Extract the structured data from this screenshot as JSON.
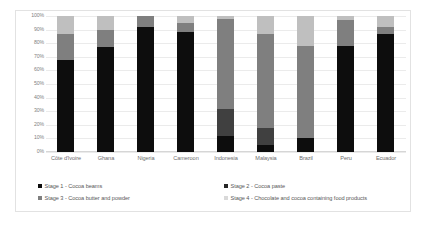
{
  "chart_data": {
    "type": "bar",
    "subtype": "stacked-percentage-column",
    "title": "",
    "xlabel": "",
    "ylabel": "",
    "ylim": [
      0,
      100
    ],
    "ytick_labels": [
      "100%",
      "90%",
      "80%",
      "70%",
      "60%",
      "50%",
      "40%",
      "30%",
      "20%",
      "10%",
      "0%"
    ],
    "ytick_values": [
      100,
      90,
      80,
      70,
      60,
      50,
      40,
      30,
      20,
      10,
      0
    ],
    "grid": true,
    "legend_position": "bottom",
    "categories": [
      "Côte d'Ivoire",
      "Ghana",
      "Nigeria",
      "Cameroon",
      "Indonesia",
      "Malaysia",
      "Brazil",
      "Peru",
      "Ecuador"
    ],
    "series": [
      {
        "name": "Stage 1 - Cocoa beans",
        "color": "#0d0d0d",
        "values": [
          68,
          77,
          92,
          88,
          12,
          5,
          10,
          78,
          87
        ]
      },
      {
        "name": "Stage 2 - Cocoa paste",
        "color": "#404040",
        "values": [
          0,
          0,
          0,
          0,
          20,
          13,
          0,
          0,
          0
        ]
      },
      {
        "name": "Stage 3 - Cocoa butter and powder",
        "color": "#7f7f7f",
        "values": [
          19,
          13,
          8,
          7,
          66,
          69,
          68,
          19,
          5
        ]
      },
      {
        "name": "Stage 4 - Chocolate and cocoa containing food products",
        "color": "#bfbfbf",
        "values": [
          13,
          10,
          0,
          5,
          2,
          13,
          22,
          3,
          8
        ]
      }
    ]
  },
  "legend": {
    "items": [
      {
        "label": "Stage 1 - Cocoa beams",
        "color": "#0d0d0d"
      },
      {
        "label": "Stage 2 - Cocoa paste",
        "color": "#262626"
      },
      {
        "label": "Stage 3 - Cocoa butter and powder",
        "color": "#7f7f7f"
      },
      {
        "label": "Stage 4 - Chocolate and cocoa containing food products",
        "color": "#d9d9d9"
      }
    ]
  }
}
